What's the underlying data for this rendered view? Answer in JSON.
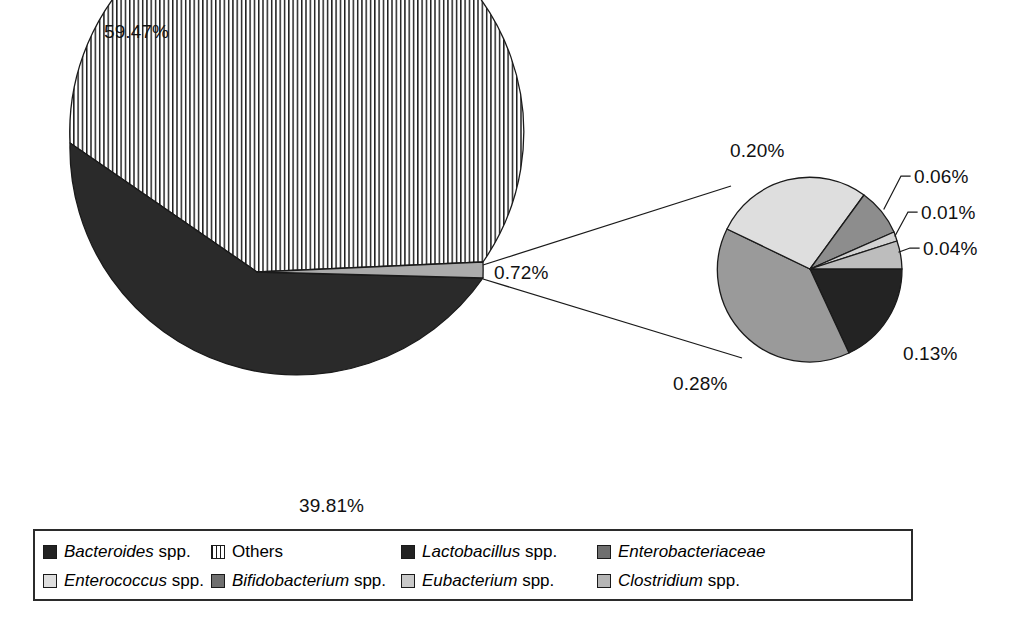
{
  "chart_data": {
    "type": "pie",
    "title": "",
    "subtitle": "",
    "note": "Pie of pie: main pie with an exploded 0.72% group expanded into a secondary pie of six minor taxa.",
    "main_pie": {
      "labels": [
        "Others",
        "Bacteroides spp.",
        "Minor taxa (expanded)"
      ],
      "values": [
        59.47,
        39.81,
        0.72
      ],
      "value_labels": [
        "59.47%",
        "39.81%",
        "0.72%"
      ],
      "fills": [
        "striped-vertical",
        "#2a2a2a",
        "#a8a8a8"
      ]
    },
    "secondary_pie": {
      "labels": [
        "Lactobacillus spp.",
        "Eubacterium spp.",
        "Clostridium spp.",
        "Enterobacteriaceae",
        "Enterococcus spp.",
        "Bifidobacterium spp."
      ],
      "values": [
        0.13,
        0.04,
        0.01,
        0.06,
        0.2,
        0.28
      ],
      "value_labels": [
        "0.13%",
        "0.04%",
        "0.01%",
        "0.06%",
        "0.20%",
        "0.28%"
      ],
      "fills": [
        "#232323",
        "#bdbdbd",
        "#d2d2d2",
        "#8d8d8d",
        "#dedede",
        "#9a9a9a"
      ]
    },
    "labels": {
      "main_others": "59.47%",
      "main_bacteroides": "39.81%",
      "main_minor": "0.72%",
      "sec_enterococcus": "0.20%",
      "sec_enterobacteriaceae": "0.06%",
      "sec_clostridium": "0.01%",
      "sec_eubacterium": "0.04%",
      "sec_lactobacillus": "0.13%",
      "sec_bifidobacterium": "0.28%"
    },
    "legend_position": "bottom",
    "grid": false
  },
  "legend": {
    "items": [
      {
        "name": "Bacteroides",
        "suffix": " spp.",
        "swatch": "#232323",
        "pattern": "solid"
      },
      {
        "name": "Others",
        "suffix": "",
        "swatch": "#ffffff",
        "pattern": "striped",
        "plain": true
      },
      {
        "name": "Lactobacillus",
        "suffix": " spp.",
        "swatch": "#232323",
        "pattern": "solid"
      },
      {
        "name": "Enterobacteriaceae",
        "suffix": "",
        "swatch": "#6f6f6f",
        "pattern": "solid"
      },
      {
        "name": "Enterococcus",
        "suffix": " spp.",
        "swatch": "#dedede",
        "pattern": "solid"
      },
      {
        "name": "Bifidobacterium",
        "suffix": " spp.",
        "swatch": "#6f6f6f",
        "pattern": "solid"
      },
      {
        "name": "Eubacterium",
        "suffix": " spp.",
        "swatch": "#c9c9c9",
        "pattern": "solid"
      },
      {
        "name": "Clostridium",
        "suffix": " spp.",
        "swatch": "#b5b5b5",
        "pattern": "solid"
      }
    ]
  },
  "colors": {
    "outline": "#1a1a1a",
    "background": "#ffffff",
    "legend_border": "#2b2b2b"
  }
}
